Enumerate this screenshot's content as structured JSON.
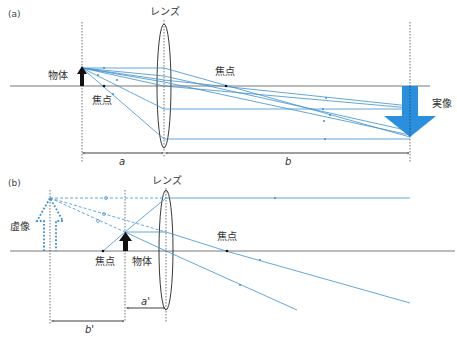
{
  "panel_a": {
    "label": "(a)",
    "lens_label": "レンズ",
    "object_label": "物体",
    "focus_left_label": "焦点",
    "focus_right_label": "焦点",
    "image_label": "実像",
    "dim_a": "a",
    "dim_b": "b"
  },
  "panel_b": {
    "label": "(b)",
    "lens_label": "レンズ",
    "object_label": "物体",
    "focus_left_label": "焦点",
    "focus_right_label": "焦点",
    "image_label": "虚像",
    "dim_a": "a'",
    "dim_b": "b'"
  },
  "colors": {
    "ray": "#3d8fd0",
    "real_image": "#2a8fdc",
    "object": "#111111"
  }
}
